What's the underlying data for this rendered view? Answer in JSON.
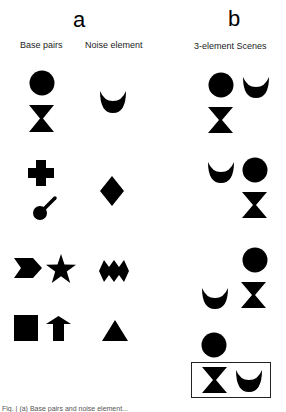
{
  "figure": {
    "panel_a": {
      "letter": "a",
      "col_labels": {
        "base_pairs": "Base pairs",
        "noise_element": "Noise element"
      },
      "rows": [
        {
          "base_pair": [
            "circle",
            "hourglass"
          ],
          "noise": "crescent"
        },
        {
          "base_pair": [
            "cross",
            "lollipop"
          ],
          "noise": "diamond"
        },
        {
          "base_pair": [
            "chevron",
            "star"
          ],
          "noise": "zigzag-diamonds"
        },
        {
          "base_pair": [
            "square",
            "arrow-up"
          ],
          "noise": "triangle"
        }
      ]
    },
    "panel_b": {
      "letter": "b",
      "col_label": "3-element Scenes",
      "scenes": [
        {
          "elements": [
            "circle",
            "hourglass",
            "crescent"
          ],
          "arrangement": "circle above hourglass, crescent right"
        },
        {
          "elements": [
            "crescent",
            "circle",
            "hourglass"
          ],
          "arrangement": "crescent left, circle above hourglass right"
        },
        {
          "elements": [
            "circle",
            "hourglass",
            "crescent"
          ],
          "arrangement": "circle above hourglass right, crescent lower left"
        },
        {
          "elements": [
            "circle",
            "hourglass",
            "crescent"
          ],
          "arrangement": "circle above, hourglass and crescent boxed below",
          "boxed": true
        }
      ]
    },
    "caption_fragment": "Fig. | (a) Base pairs and noise element..."
  }
}
